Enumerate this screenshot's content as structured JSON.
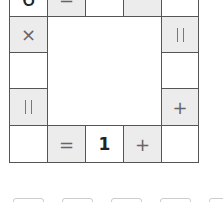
{
  "puzzle": {
    "rows": [
      [
        {
          "text": "6",
          "bg": "white"
        },
        {
          "text": "=",
          "bg": "gray"
        },
        {
          "text": "",
          "bg": "white"
        },
        {
          "text": "",
          "bg": "gray"
        },
        {
          "text": "",
          "bg": "white"
        }
      ],
      [
        {
          "text": "×",
          "bg": "gray"
        },
        null,
        null,
        null,
        {
          "text": "=",
          "bg": "gray",
          "rotated": true
        }
      ],
      [
        {
          "text": "",
          "bg": "white"
        },
        null,
        null,
        null,
        {
          "text": "",
          "bg": "white"
        }
      ],
      [
        {
          "text": "=",
          "bg": "gray",
          "rotated": true
        },
        null,
        null,
        null,
        {
          "text": "+",
          "bg": "gray"
        }
      ],
      [
        {
          "text": "",
          "bg": "white"
        },
        {
          "text": "=",
          "bg": "gray"
        },
        {
          "text": "1",
          "bg": "white"
        },
        {
          "text": "+",
          "bg": "gray"
        },
        {
          "text": "",
          "bg": "white"
        }
      ]
    ],
    "colors": {
      "gray_cell": "#ececec",
      "white_cell": "#ffffff",
      "border": "#555555",
      "tray_border": "#cccccc"
    }
  },
  "tray": {
    "slots": [
      "",
      "",
      "",
      "",
      ""
    ]
  }
}
